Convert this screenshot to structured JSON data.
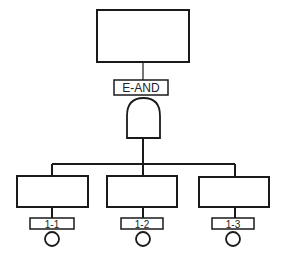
{
  "diagram": {
    "type": "fault-tree",
    "top_event": {
      "label": ""
    },
    "gate": {
      "label": "E-AND",
      "type": "AND"
    },
    "children": [
      {
        "label": "",
        "event_id": "1-1"
      },
      {
        "label": "",
        "event_id": "1-2"
      },
      {
        "label": "",
        "event_id": "1-3"
      }
    ]
  },
  "colors": {
    "stroke": "#1a1a1a",
    "background": "#ffffff"
  }
}
